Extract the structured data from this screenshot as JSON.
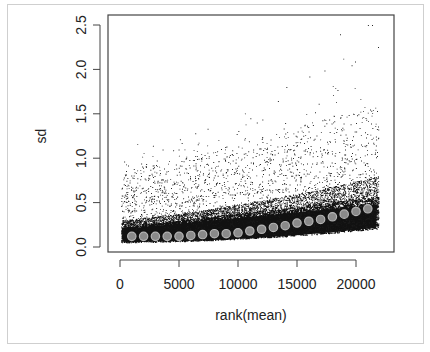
{
  "chart_data": {
    "type": "scatter",
    "title": "",
    "xlabel": "rank(mean)",
    "ylabel": "sd",
    "xlim": [
      0,
      22000
    ],
    "ylim": [
      0,
      2.5
    ],
    "x_ticks": [
      "0",
      "5000",
      "10000",
      "15000",
      "20000"
    ],
    "y_ticks": [
      "0.0",
      "0.5",
      "1.0",
      "1.5",
      "2.0",
      "2.5"
    ],
    "grid": false,
    "legend": "none",
    "series": [
      {
        "name": "genes (sd vs rank of mean)",
        "style": "small black points",
        "description": "~22000 points; dense band near sd 0.05-0.35 increasing with rank; sparse outliers up to ~2.5 at high rank"
      },
      {
        "name": "running median",
        "style": "grey filled circles",
        "x": [
          1000,
          2000,
          3000,
          4000,
          5000,
          6000,
          7000,
          8000,
          9000,
          10000,
          11000,
          12000,
          13000,
          14000,
          15000,
          16000,
          17000,
          18000,
          19000,
          20000,
          21000
        ],
        "values": [
          0.12,
          0.12,
          0.12,
          0.12,
          0.12,
          0.13,
          0.14,
          0.15,
          0.15,
          0.16,
          0.18,
          0.2,
          0.22,
          0.24,
          0.27,
          0.29,
          0.31,
          0.34,
          0.37,
          0.4,
          0.43
        ]
      }
    ]
  },
  "axes": {
    "xlabel": "rank(mean)",
    "ylabel": "sd",
    "x_ticks": [
      "0",
      "5000",
      "10000",
      "15000",
      "20000"
    ],
    "y_ticks": [
      "0.0",
      "0.5",
      "1.0",
      "1.5",
      "2.0",
      "2.5"
    ]
  }
}
